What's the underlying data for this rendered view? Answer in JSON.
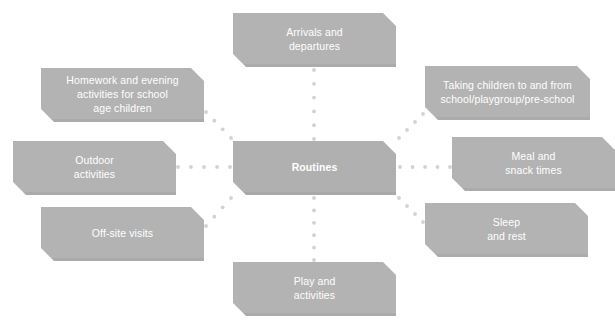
{
  "diagram": {
    "title": "Routines",
    "type": "spoke-and-hub",
    "center": {
      "id": "routines",
      "label": "Routines",
      "x": 233,
      "y": 141,
      "w": 163,
      "h": 54
    },
    "nodes": [
      {
        "id": "arrivals-and-departures",
        "label": "Arrivals and\ndepartures",
        "line1": "Arrivals and",
        "line2": "departures",
        "x": 233,
        "y": 13,
        "w": 163,
        "h": 54
      },
      {
        "id": "taking-children-to-and-from-school",
        "label": "Taking children to and from\nschool/playgroup/pre-school",
        "line1": "Taking children to and from",
        "line2": "school/playgroup/pre-school",
        "x": 425,
        "y": 66,
        "w": 165,
        "h": 54
      },
      {
        "id": "meal-and-snack-times",
        "label": "Meal and\nsnack times",
        "line1": "Meal and",
        "line2": "snack times",
        "x": 452,
        "y": 137,
        "w": 163,
        "h": 54
      },
      {
        "id": "sleep-and-rest",
        "label": "Sleep\nand rest",
        "line1": "Sleep",
        "line2": "and rest",
        "x": 425,
        "y": 203,
        "w": 163,
        "h": 54
      },
      {
        "id": "play-and-activities",
        "label": "Play and\nactivities",
        "line1": "Play and",
        "line2": "activities",
        "x": 233,
        "y": 262,
        "w": 163,
        "h": 54
      },
      {
        "id": "off-site-visits",
        "label": "Off-site visits",
        "line1": "Off-site visits",
        "line2": "",
        "x": 41,
        "y": 207,
        "w": 163,
        "h": 54
      },
      {
        "id": "outdoor-activities",
        "label": "Outdoor\nactivities",
        "line1": "Outdoor",
        "line2": "activities",
        "x": 13,
        "y": 141,
        "w": 163,
        "h": 54
      },
      {
        "id": "homework-and-evening-activities",
        "label": "Homework and evening\nactivities for school\nage children",
        "line1": "Homework and evening",
        "line2": "activities for school",
        "line3": "age children",
        "x": 41,
        "y": 68,
        "w": 163,
        "h": 54
      }
    ],
    "connectors": [
      {
        "id": "center-to-arrivals",
        "from": "routines",
        "to": "arrivals-and-departures",
        "x1": 314,
        "y1": 139,
        "x2": 314,
        "y2": 70
      },
      {
        "id": "center-to-taking",
        "from": "routines",
        "to": "taking-children-to-and-from-school",
        "x1": 399,
        "y1": 138,
        "x2": 423,
        "y2": 114
      },
      {
        "id": "center-to-meal",
        "from": "routines",
        "to": "meal-and-snack-times",
        "x1": 400,
        "y1": 167,
        "x2": 450,
        "y2": 167
      },
      {
        "id": "center-to-sleep",
        "from": "routines",
        "to": "sleep-and-rest",
        "x1": 399,
        "y1": 198,
        "x2": 423,
        "y2": 222
      },
      {
        "id": "center-to-play",
        "from": "routines",
        "to": "play-and-activities",
        "x1": 314,
        "y1": 198,
        "x2": 314,
        "y2": 260
      },
      {
        "id": "center-to-offsite",
        "from": "routines",
        "to": "off-site-visits",
        "x1": 231,
        "y1": 198,
        "x2": 206,
        "y2": 226
      },
      {
        "id": "center-to-outdoor",
        "from": "routines",
        "to": "outdoor-activities",
        "x1": 230,
        "y1": 167,
        "x2": 178,
        "y2": 167
      },
      {
        "id": "center-to-homework",
        "from": "routines",
        "to": "homework-and-evening-activities",
        "x1": 231,
        "y1": 138,
        "x2": 206,
        "y2": 112
      }
    ],
    "colors": {
      "node_fill": "#b3b3b3",
      "node_text": "#ffffff",
      "connector_dot": "#d2d2d2",
      "background": "#ffffff"
    },
    "connector_style": {
      "shape": "dotted",
      "dot_radius": 1.9,
      "dot_spacing": 13
    }
  }
}
